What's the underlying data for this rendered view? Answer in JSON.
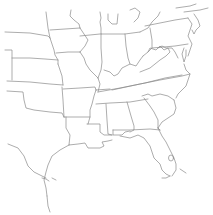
{
  "map": {
    "background": "#ffffff",
    "border_color": "#8a8a8a",
    "border_width": 0.7,
    "regions": [
      {
        "name": "south-dakota-nebraska-border",
        "points": "5,32 30,33 48,36 50,38"
      },
      {
        "name": "minnesota-iowa-area-west",
        "points": "46,12 47,20 48,28 50,38"
      },
      {
        "name": "nebraska-iowa-border",
        "points": "50,38 52,44 54,50 55,55 58,60 58,64"
      },
      {
        "name": "nebraska-kansas-border",
        "points": "12,58 30,58 45,59 58,60"
      },
      {
        "name": "colorado-nebraska-west",
        "points": "5,50 12,50 12,58 12,80"
      },
      {
        "name": "kansas-oklahoma-border",
        "points": "7,81 30,82 50,84 63,85"
      },
      {
        "name": "kansas-missouri-border",
        "points": "58,64 60,70 62,76 63,85"
      },
      {
        "name": "iowa-north-border",
        "points": "50,30 65,29 80,28"
      },
      {
        "name": "minnesota-wisconsin",
        "points": "71,10 70,16 74,20 79,24 80,28"
      },
      {
        "name": "iowa-illinois-river",
        "points": "80,28 84,34 88,40 85,46 80,52"
      },
      {
        "name": "iowa-missouri-border",
        "points": "56,53 68,52 80,52"
      },
      {
        "name": "wisconsin-illinois-border",
        "points": "80,36 100,34"
      },
      {
        "name": "michigan-wisconsin",
        "points": "100,12 101,18 100,22 101,28 101,34"
      },
      {
        "name": "illinois-indiana-border",
        "points": "101,34 101,48 102,62 101,70 98,78"
      },
      {
        "name": "missouri-illinois-river",
        "points": "80,52 84,58 86,64 90,70 94,74 98,78"
      },
      {
        "name": "missouri-arkansas-border",
        "points": "63,89 80,88 95,87 96,90"
      },
      {
        "name": "oklahoma-texas-red-river",
        "points": "7,91 23,92 24,100 26,108 34,110 50,112 62,113 64,117"
      },
      {
        "name": "oklahoma-arkansas-border",
        "points": "62,87 63,100 64,117"
      },
      {
        "name": "arkansas-louisiana-border",
        "points": "64,117 76,117 90,117"
      },
      {
        "name": "arkansas-mississippi-river",
        "points": "96,90 94,96 92,104 90,110 90,117 88,124"
      },
      {
        "name": "texas-louisiana-border",
        "points": "66,117 66,128 70,135 69,145"
      },
      {
        "name": "louisiana-coast",
        "points": "69,145 78,144 85,143 88,148 100,148 104,146 102,142 108,141 112,140"
      },
      {
        "name": "louisiana-mississippi-border",
        "points": "87,124 100,124 100,132 104,135 112,135"
      },
      {
        "name": "texas-coast",
        "points": "69,145 60,150 52,156 48,165 46,172 44,180 46,188 47,196"
      },
      {
        "name": "texas-lower-coast",
        "points": "47,196 48,206 50,212"
      },
      {
        "name": "mexico-border-rio-grande",
        "points": "8,144 18,148 24,156 28,166 34,172 42,176 46,178"
      },
      {
        "name": "brownsville-area",
        "points": "42,178 46,179 49,181"
      },
      {
        "name": "tennessee-north-border",
        "points": "98,92 120,88 145,83 165,78 182,75"
      },
      {
        "name": "kentucky-tennessee-inner",
        "points": "96,90 110,89"
      },
      {
        "name": "kentucky-north-ohio-river",
        "points": "104,70 110,72 114,76 118,74 122,68 130,64 136,66 140,60 143,56"
      },
      {
        "name": "kentucky-west",
        "points": "98,78 100,84 98,92"
      },
      {
        "name": "indiana-ohio-border",
        "points": "125,34 126,46 128,58 130,64"
      },
      {
        "name": "michigan-indiana-ohio",
        "points": "101,34 115,34 125,34 140,32"
      },
      {
        "name": "michigan-lower",
        "points": "108,14 108,20 112,24 117,24 118,14"
      },
      {
        "name": "michigan-thumb",
        "points": "130,10 135,8 140,12 138,18 134,22"
      },
      {
        "name": "lake-erie-shore",
        "points": "140,32 148,28 152,22 158,16 160,12"
      },
      {
        "name": "ohio-pennsylvania-border",
        "points": "150,28 152,40 152,48 148,52"
      },
      {
        "name": "west-virginia",
        "points": "143,56 148,52 150,48 156,50 160,46 164,50 168,48 170,52 166,56 160,60 155,64 150,68 145,70 140,72"
      },
      {
        "name": "pennsylvania-north",
        "points": "145,26 175,20 188,18"
      },
      {
        "name": "pennsylvania-south-maryland",
        "points": "152,48 175,46 188,44"
      },
      {
        "name": "maryland-virginia-potomac",
        "points": "158,48 162,46 166,48 172,48 175,52 178,58"
      },
      {
        "name": "delaware-bay",
        "points": "188,18 192,24 190,30 188,36 190,40 192,44 190,50 188,56"
      },
      {
        "name": "chesapeake-peninsula",
        "points": "184,48 182,54 184,62 186,56 186,50"
      },
      {
        "name": "new-jersey",
        "points": "194,14 198,20 200,26 196,30 194,34 192,30"
      },
      {
        "name": "new-york-area",
        "points": "176,8 190,6 196,4"
      },
      {
        "name": "ny-southern",
        "points": "184,12 200,10 208,8"
      },
      {
        "name": "virginia-nc-border",
        "points": "112,90 140,84 160,80 182,76 190,74"
      },
      {
        "name": "atlantic-nc-coast",
        "points": "184,64 186,70 190,74 188,80 186,86 182,90 178,94 176,98"
      },
      {
        "name": "tennessee-south-border",
        "points": "96,104 110,103 130,102 148,99"
      },
      {
        "name": "nc-sc-border",
        "points": "142,96 148,94 152,96 160,94 168,96 174,100"
      },
      {
        "name": "sc-coast",
        "points": "174,100 176,108 174,114 168,118 162,122 158,128"
      },
      {
        "name": "georgia-sc-border",
        "points": "144,98 150,106 154,112 158,120 158,128"
      },
      {
        "name": "mississippi-alabama-border",
        "points": "106,104 107,120 108,134 112,135"
      },
      {
        "name": "alabama-georgia-border",
        "points": "127,102 131,116 134,126 134,130 130,132"
      },
      {
        "name": "florida-panhandle-north",
        "points": "113,130 130,130 150,129 160,130"
      },
      {
        "name": "florida-al-border",
        "points": "113,130 113,135 122,135 125,132 130,131"
      },
      {
        "name": "florida-gulf-coast",
        "points": "120,136 130,138 138,135 144,138 150,146 152,152 154,158 160,164 162,170 166,174 170,176"
      },
      {
        "name": "florida-atlantic-coast",
        "points": "158,128 162,136 166,142 170,150 174,158 176,164 176,170 172,176"
      },
      {
        "name": "florida-keys",
        "points": "170,176 166,178 162,178"
      },
      {
        "name": "georgia-florida-gap",
        "points": "160,130 158,128"
      }
    ],
    "lakes": [
      {
        "name": "lake-okeechobee",
        "cx": 171,
        "cy": 158,
        "rx": 2.5,
        "ry": 3
      }
    ],
    "markers": [
      {
        "name": "florida-keys-pointer",
        "points": "180,169 186,173"
      },
      {
        "name": "texas-coast-pointer",
        "points": "52,178 56,180"
      }
    ]
  }
}
